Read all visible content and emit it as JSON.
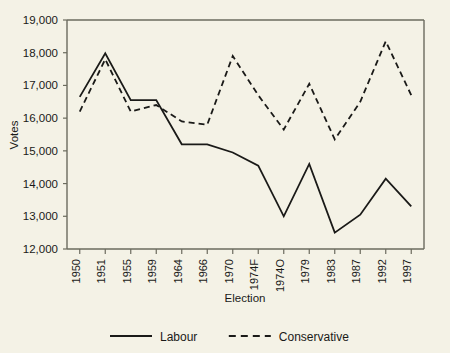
{
  "chart_data": {
    "type": "line",
    "title": "",
    "xlabel": "Election",
    "ylabel": "Votes",
    "categories": [
      "1950",
      "1951",
      "1955",
      "1959",
      "1964",
      "1966",
      "1970",
      "1974F",
      "1974O",
      "1979",
      "1983",
      "1987",
      "1992",
      "1997"
    ],
    "ylim": [
      12000,
      19000
    ],
    "yticks": [
      "12,000",
      "13,000",
      "14,000",
      "15,000",
      "16,000",
      "17,000",
      "18,000",
      "19,000"
    ],
    "ytick_values": [
      12000,
      13000,
      14000,
      15000,
      16000,
      17000,
      18000,
      19000
    ],
    "grid": false,
    "legend_position": "bottom",
    "series": [
      {
        "name": "Labour",
        "style": "solid",
        "color": "#1a1a18",
        "values": [
          16650,
          17980,
          16550,
          16550,
          15200,
          15200,
          14950,
          14550,
          13000,
          14600,
          12500,
          13050,
          14150,
          13300
        ]
      },
      {
        "name": "Conservative",
        "style": "dashed",
        "color": "#1a1a18",
        "values": [
          16200,
          17800,
          16200,
          16400,
          15900,
          15800,
          17900,
          16700,
          15650,
          17050,
          15350,
          16500,
          18350,
          16700
        ]
      }
    ]
  },
  "axis": {
    "y_title": "Votes",
    "x_title": "Election"
  },
  "legend": {
    "items": [
      {
        "label": "Labour",
        "style": "solid"
      },
      {
        "label": "Conservative",
        "style": "dashed"
      }
    ]
  },
  "colors": {
    "background": "#f4f2e6",
    "axis": "#6b6b5e",
    "ink": "#1a1a18"
  }
}
